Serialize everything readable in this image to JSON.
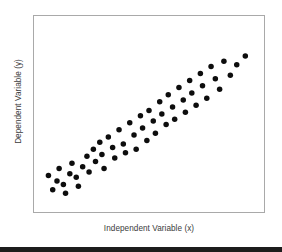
{
  "figure": {
    "background_color": "#ffffff",
    "frame_color": "#a9a9a9",
    "point_color": "#0d0d0d",
    "bottom_band_color": "#1c1c1c"
  },
  "labels": {
    "x_axis_title": "Independent Variable (x)",
    "y_axis_title": "Dependent Variable (y)"
  },
  "chart_data": {
    "type": "scatter",
    "title": "",
    "xlabel": "Independent Variable (x)",
    "ylabel": "Dependent Variable (y)",
    "xlim": [
      0,
      100
    ],
    "ylim": [
      0,
      100
    ],
    "grid": false,
    "legend": null,
    "xticks": [],
    "yticks": [],
    "point_color": "#0d0d0d",
    "point_size_px": 5.5,
    "n_points": 55,
    "correlation": "positive",
    "series": [
      {
        "name": "observations",
        "x": [
          3,
          5,
          7,
          8,
          10,
          11,
          13,
          14,
          16,
          17,
          19,
          21,
          22,
          24,
          25,
          27,
          28,
          29,
          31,
          33,
          34,
          36,
          38,
          39,
          41,
          43,
          44,
          46,
          47,
          49,
          50,
          52,
          53,
          55,
          56,
          58,
          59,
          61,
          62,
          64,
          66,
          67,
          69,
          70,
          72,
          74,
          75,
          77,
          79,
          81,
          83,
          85,
          88,
          91,
          95
        ],
        "y": [
          15,
          7,
          12,
          19,
          10,
          5,
          16,
          22,
          14,
          9,
          20,
          26,
          17,
          30,
          23,
          34,
          27,
          19,
          37,
          31,
          25,
          41,
          33,
          28,
          45,
          38,
          30,
          49,
          42,
          35,
          52,
          46,
          39,
          57,
          50,
          44,
          61,
          54,
          47,
          65,
          58,
          51,
          69,
          62,
          55,
          73,
          66,
          59,
          77,
          70,
          64,
          80,
          72,
          78,
          83
        ]
      }
    ]
  }
}
